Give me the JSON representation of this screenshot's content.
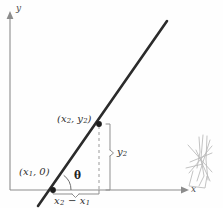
{
  "figure": {
    "background_color": "#fefefe",
    "ink_color": "#2e2e2e",
    "axis_color": "#8c8c8c",
    "dashed_color": "#9a9a9a",
    "artifact_color": "#b3b3b3"
  },
  "axes": {
    "y_label": "y",
    "x_label": "x",
    "origin": {
      "x": 10,
      "y": 190
    },
    "x_axis": {
      "x1": 10,
      "y1": 190,
      "x2": 183,
      "y2": 190
    },
    "y_axis": {
      "x1": 10,
      "y1": 190,
      "x2": 10,
      "y2": 16
    }
  },
  "line": {
    "label": "straight line",
    "x1": 38,
    "y1": 206,
    "x2": 167,
    "y2": 21,
    "stroke_width": 2.6
  },
  "points": [
    {
      "name": "x-intercept",
      "label_prefix": "(",
      "label_var": "x",
      "label_sub": "1",
      "label_suffix": ", 0)",
      "cx": 53,
      "cy": 190,
      "label_x": 19,
      "label_y": 167
    },
    {
      "name": "second-point",
      "label_prefix": "(",
      "label_var": "x",
      "label_sub": "2",
      "label_suffix": ")",
      "cx": 99,
      "cy": 124,
      "label_x": 57,
      "label_y": 114
    }
  ],
  "labels": {
    "point1_text": "(x1, 0)",
    "point2_text": "(x2, y2)",
    "theta": "θ",
    "rise_text": "y2",
    "run_text": "x2 − x1",
    "run_minus": "−",
    "y_axis_text": "y",
    "x_axis_text": "x"
  },
  "annotations": {
    "rise": {
      "name": "vertical-brace-y2",
      "var": "y",
      "sub": "2",
      "brace_x": 110,
      "brace_top": 124,
      "brace_bottom": 190,
      "label_x": 116,
      "label_y": 152
    },
    "run": {
      "name": "horizontal-brace-x2-minus-x1",
      "brace_y": 194,
      "brace_left": 53,
      "brace_right": 99,
      "label_x": 54,
      "label_y": 197
    },
    "theta_arc": {
      "center_x": 53,
      "center_y": 190,
      "radius": 18,
      "start_angle_deg": 0,
      "end_angle_deg": 55,
      "label_x": 74,
      "label_y": 171
    },
    "dashed_drop": {
      "x": 99,
      "y_top": 124,
      "y_bottom": 190,
      "dash_pattern": "3,3"
    }
  },
  "artifact": {
    "name": "scan-pencil-scribble",
    "x": 183,
    "y": 133,
    "width": 36,
    "height": 56,
    "description": "faint overlapping pencil strokes scanned from facing page"
  }
}
